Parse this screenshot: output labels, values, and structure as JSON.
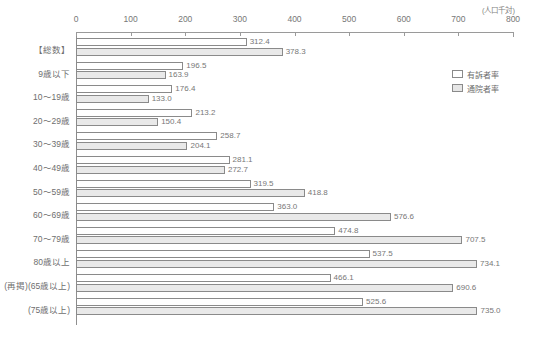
{
  "chart_data": {
    "type": "bar",
    "orientation": "horizontal",
    "title": "",
    "unit_caption": "(人口千対)",
    "xlabel": "",
    "ylabel": "",
    "xlim": [
      0,
      800
    ],
    "xticks": [
      0,
      100,
      200,
      300,
      400,
      500,
      600,
      700,
      800
    ],
    "xtick_labels": [
      "0",
      "100",
      "200",
      "300",
      "400",
      "500",
      "600",
      "700",
      "800"
    ],
    "grid": false,
    "legend_position": "upper-right",
    "categories": [
      "【総数】",
      "9歳以下",
      "10〜19歳",
      "20〜29歳",
      "30〜39歳",
      "40〜49歳",
      "50〜59歳",
      "60〜69歳",
      "70〜79歳",
      "80歳以上",
      "(再掲)(65歳以上)",
      "(75歳以上)"
    ],
    "series": [
      {
        "name": "有訴者率",
        "color": "#ffffff",
        "values": [
          312.4,
          196.5,
          176.4,
          213.2,
          258.7,
          281.1,
          319.5,
          363.0,
          474.8,
          537.5,
          466.1,
          525.6
        ],
        "labels": [
          "312.4",
          "196.5",
          "176.4",
          "213.2",
          "258.7",
          "281.1",
          "319.5",
          "363.0",
          "474.8",
          "537.5",
          "466.1",
          "525.6"
        ]
      },
      {
        "name": "通院者率",
        "color": "#e9e9e9",
        "values": [
          378.3,
          163.9,
          133.0,
          150.4,
          204.1,
          272.7,
          418.8,
          576.6,
          707.5,
          734.1,
          690.6,
          735.0
        ],
        "labels": [
          "378.3",
          "163.9",
          "133.0",
          "150.4",
          "204.1",
          "272.7",
          "418.8",
          "576.6",
          "707.5",
          "734.1",
          "690.6",
          "735.0"
        ]
      }
    ]
  }
}
